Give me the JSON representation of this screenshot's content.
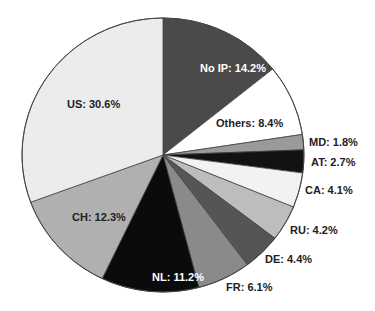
{
  "chart_data": {
    "type": "pie",
    "title": "",
    "start_angle_deg": 0,
    "direction": "clockwise",
    "center": [
      163,
      155
    ],
    "radius": [
      141,
      137
    ],
    "slices": [
      {
        "label": "No IP",
        "value": 14.2,
        "text": "No IP: 14.2%",
        "color": "#4a4a4a",
        "text_color": "#ffffff",
        "lx": 200,
        "ly": 72
      },
      {
        "label": "Others",
        "value": 8.4,
        "text": "Others: 8.4%",
        "color": "#ffffff",
        "text_color": "#222222",
        "lx": 216,
        "ly": 127
      },
      {
        "label": "MD",
        "value": 1.8,
        "text": "MD: 1.8%",
        "color": "#9a9a9a",
        "text_color": "#222222",
        "lx": 309,
        "ly": 146
      },
      {
        "label": "AT",
        "value": 2.7,
        "text": "AT: 2.7%",
        "color": "#121212",
        "text_color": "#222222",
        "lx": 311,
        "ly": 166
      },
      {
        "label": "CA",
        "value": 4.1,
        "text": "CA: 4.1%",
        "color": "#f2f2f2",
        "text_color": "#222222",
        "lx": 305,
        "ly": 194
      },
      {
        "label": "RU",
        "value": 4.2,
        "text": "RU: 4.2%",
        "color": "#bdbdbd",
        "text_color": "#222222",
        "lx": 290,
        "ly": 234
      },
      {
        "label": "DE",
        "value": 4.4,
        "text": "DE: 4.4%",
        "color": "#555555",
        "text_color": "#222222",
        "lx": 265,
        "ly": 263
      },
      {
        "label": "FR",
        "value": 6.1,
        "text": "FR: 6.1%",
        "color": "#8a8a8a",
        "text_color": "#222222",
        "lx": 226,
        "ly": 291
      },
      {
        "label": "NL",
        "value": 11.2,
        "text": "NL: 11.2%",
        "color": "#0b0b0b",
        "text_color": "#ffffff",
        "lx": 152,
        "ly": 281
      },
      {
        "label": "CH",
        "value": 12.3,
        "text": "CH: 12.3%",
        "color": "#b0b0b0",
        "text_color": "#222222",
        "lx": 72,
        "ly": 221
      },
      {
        "label": "US",
        "value": 30.6,
        "text": "US: 30.6%",
        "color": "#ececec",
        "text_color": "#222222",
        "lx": 67,
        "ly": 108
      }
    ],
    "legend": null
  }
}
